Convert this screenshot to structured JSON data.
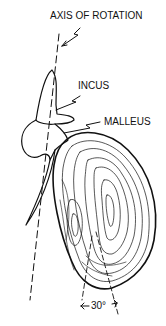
{
  "diagram": {
    "labels": {
      "axis": "AXIS OF ROTATION",
      "incus": "INCUS",
      "malleus": "MALLEUS",
      "angle": "30°"
    },
    "colors": {
      "ink": "#111111",
      "background": "#ffffff"
    }
  }
}
